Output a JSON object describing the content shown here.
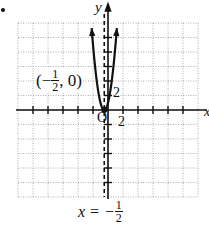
{
  "chart_data": {
    "type": "line",
    "title": "",
    "xlabel": "x",
    "ylabel": "y",
    "xlim": [
      -12,
      12
    ],
    "ylim": [
      -12,
      12
    ],
    "grid": true,
    "tick_step": 2,
    "tick_labels": {
      "x": "2",
      "y": "2",
      "origin": "O"
    },
    "series": [
      {
        "name": "parabola",
        "equation": "y = (2x + 1)^2",
        "vertex": [
          -0.5,
          0
        ],
        "x": [
          -2.2,
          -2.0,
          -1.5,
          -1.0,
          -0.5,
          0.0,
          0.5,
          1.0,
          1.2
        ],
        "y": [
          11.56,
          9.0,
          4.0,
          1.0,
          0.0,
          1.0,
          4.0,
          9.0,
          11.56
        ]
      }
    ],
    "annotations": [
      {
        "text_prefix": "(−",
        "fraction": {
          "num": "1",
          "den": "2"
        },
        "text_suffix": ", 0)",
        "at": [
          -0.5,
          0
        ]
      },
      {
        "text": "x = −",
        "fraction": {
          "num": "1",
          "den": "2"
        },
        "kind": "axis of symmetry",
        "line_x": -0.5,
        "style": "dashed"
      }
    ]
  },
  "labels": {
    "y_axis": "y",
    "x_axis": "x",
    "origin": "O",
    "tick_y": "2",
    "tick_x": "2",
    "vertex_open": "(−",
    "vertex_num": "1",
    "vertex_den": "2",
    "vertex_close": ", 0)",
    "axis_eq_prefix": "x = −",
    "axis_eq_num": "1",
    "axis_eq_den": "2"
  }
}
